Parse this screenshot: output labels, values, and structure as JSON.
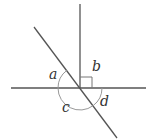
{
  "diagram": {
    "type": "intersecting-lines-angles",
    "colors": {
      "line": "#555555",
      "arc": "#999999",
      "label": "#333333",
      "background": "#ffffff"
    },
    "labels": {
      "a": "a",
      "b": "b",
      "c": "c",
      "d": "d"
    },
    "angles": [
      {
        "name": "a",
        "position": "upper-left, between horizontal line and diagonal"
      },
      {
        "name": "b",
        "position": "upper-right, right angle between vertical and horizontal"
      },
      {
        "name": "c",
        "position": "below, from horizontal left to diagonal lower-right"
      },
      {
        "name": "d",
        "position": "lower-right, between diagonal and horizontal right"
      }
    ],
    "right_angle_marker": true
  }
}
